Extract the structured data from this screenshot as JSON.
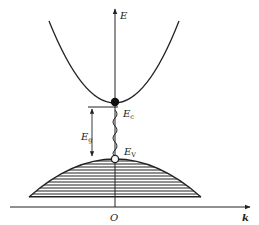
{
  "diagram": {
    "type": "band-structure",
    "axes": {
      "vertical_label": "E",
      "horizontal_label": "k",
      "origin_label": "O"
    },
    "labels": {
      "conduction_edge": "E",
      "conduction_edge_sub": "c",
      "valence_edge": "E",
      "valence_edge_sub": "V",
      "gap": "E",
      "gap_sub": "g"
    },
    "elements": {
      "conduction_band": "parabola opening upward",
      "valence_band": "hatched dome opening downward",
      "electron": "filled circle at conduction band minimum",
      "hole": "open circle at valence band maximum",
      "transition": "wavy line between band edges"
    },
    "colors": {
      "line": "#222222",
      "background": "#ffffff"
    }
  }
}
